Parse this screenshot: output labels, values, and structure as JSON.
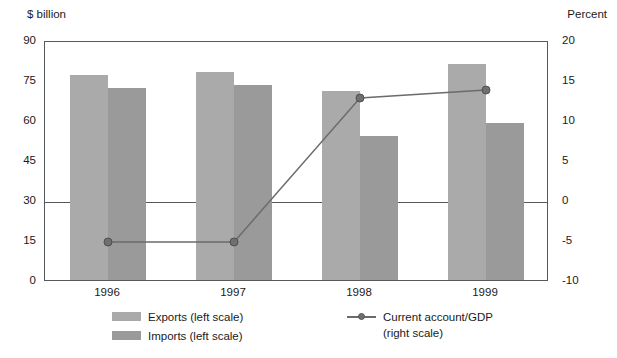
{
  "axes": {
    "left_unit": "$ billion",
    "right_unit": "Percent",
    "left_ticks": [
      "90",
      "75",
      "60",
      "45",
      "30",
      "15",
      "0"
    ],
    "right_ticks": [
      "20",
      "15",
      "10",
      "5",
      "0",
      "-5",
      "-10"
    ]
  },
  "legend": {
    "exports": "Exports (left scale)",
    "imports": "Imports (left scale)",
    "line_label": "Current account/GDP",
    "line_sublabel": "(right scale)"
  },
  "colors": {
    "exports": "#aaaaaa",
    "imports": "#9a9a9a",
    "line": "#6b6b6b",
    "marker": "#6f6f6f",
    "axis": "#55585c"
  },
  "chart_data": {
    "type": "bar",
    "title": "",
    "subtitle": "",
    "xlabel": "",
    "ylabel": "$ billion",
    "y2label": "Percent",
    "categories": [
      "1996",
      "1997",
      "1998",
      "1999"
    ],
    "ylim": [
      0,
      90
    ],
    "y2lim": [
      -10,
      20
    ],
    "yticks": [
      0,
      15,
      30,
      45,
      60,
      75,
      90
    ],
    "y2ticks": [
      -10,
      -5,
      0,
      5,
      10,
      15,
      20
    ],
    "grid": true,
    "legend_position": "bottom",
    "series": [
      {
        "name": "Exports (left scale)",
        "type": "bar",
        "axis": "left",
        "values": [
          77,
          78,
          71,
          81
        ]
      },
      {
        "name": "Imports (left scale)",
        "type": "bar",
        "axis": "left",
        "values": [
          72,
          73,
          54,
          59
        ]
      },
      {
        "name": "Current account/GDP (right scale)",
        "type": "line",
        "axis": "right",
        "values": [
          -5,
          -5,
          13,
          14
        ]
      }
    ]
  }
}
